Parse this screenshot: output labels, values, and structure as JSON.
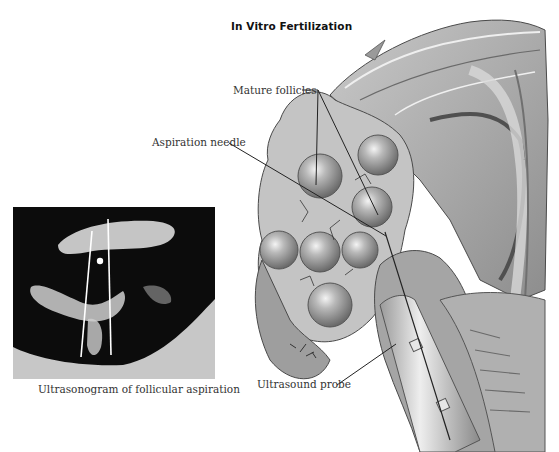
{
  "figure": {
    "title": "In Vitro Fertilization",
    "labels": {
      "mature_follicles": "Mature follicles",
      "aspiration_needle": "Aspiration needle",
      "ultrasound_probe": "Ultrasound probe"
    },
    "inset": {
      "caption": "Ultrasonogram of follicular aspiration"
    }
  },
  "colors": {
    "background": "#ffffff",
    "text": "#333333",
    "tissue_light": "#d8d8d8",
    "tissue_mid": "#a8a8a8",
    "tissue_dark": "#5a5a5a",
    "ultrasound_bg": "#0a0a0a"
  }
}
